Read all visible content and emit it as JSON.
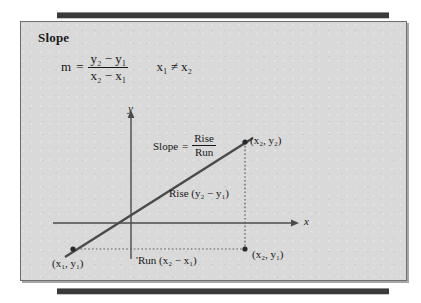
{
  "panel": {
    "title": "Slope",
    "formula": {
      "m": "m",
      "equals": "=",
      "numerator": "y₂ − y₁",
      "denominator": "x₂ − x₁",
      "condition": "x₁ ≠ x₂"
    }
  },
  "graph": {
    "y_axis_label": "y",
    "x_axis_label": "x",
    "slope_text": "Slope",
    "slope_equals": "=",
    "slope_numerator": "Rise",
    "slope_denominator": "Run",
    "rise_label": "Rise (y₂ − y₁)",
    "run_label": "Run (x₂ − x₁)",
    "point_upper": "(x₂, y₂)",
    "point_lower_left": "(x₁, y₁)",
    "point_lower_right": "(x₂, y₁)"
  },
  "colors": {
    "panel_background": "#d9d9d9",
    "panel_border": "#6e6e6e",
    "rule": "#3a3a3a",
    "ink": "#1c1c1c",
    "line": "#4a4a4a"
  }
}
